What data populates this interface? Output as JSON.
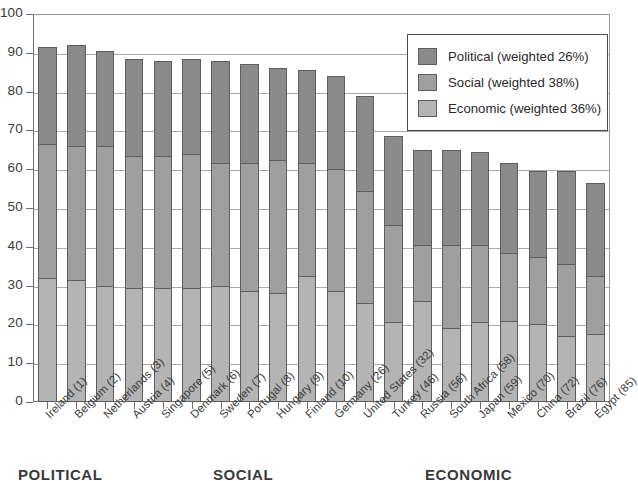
{
  "chart_data": {
    "type": "bar",
    "subtype": "stacked-bar",
    "title": "",
    "xlabel": "",
    "ylabel": "",
    "ylim": [
      0,
      100
    ],
    "ytick_step": 10,
    "yticks": [
      0,
      10,
      20,
      30,
      40,
      50,
      60,
      70,
      80,
      90,
      100
    ],
    "grid": true,
    "grid_axis": "y",
    "legend_position": "top-right",
    "categories": [
      "Ireland (1)",
      "Belgium (2)",
      "Netherlands (3)",
      "Austria (4)",
      "Singapore (5)",
      "Denmark (6)",
      "Sweden (7)",
      "Portugal (8)",
      "Hungary (9)",
      "Finland (10)",
      "Germany (26)",
      "United States (32)",
      "Turkey (46)",
      "Russia (56)",
      "South Africa (58)",
      "Japan (59)",
      "Mexico (70)",
      "China (72)",
      "Brazil (76)",
      "Egypt (85)"
    ],
    "series": [
      {
        "name": "Economic (weighted 36%)",
        "color": "#b4b4b4",
        "weight_percent": 36,
        "values": [
          32.0,
          31.5,
          30.0,
          29.5,
          29.5,
          29.5,
          30.0,
          28.5,
          28.0,
          32.5,
          28.5,
          25.5,
          20.5,
          26.0,
          19.0,
          20.5,
          21.0,
          20.0,
          17.0,
          17.5
        ]
      },
      {
        "name": "Social (weighted 38%)",
        "color": "#9f9f9f",
        "weight_percent": 38,
        "values": [
          34.5,
          34.5,
          36.0,
          34.0,
          34.0,
          34.5,
          31.5,
          33.0,
          34.5,
          29.0,
          31.5,
          29.0,
          25.0,
          14.5,
          21.5,
          20.0,
          17.5,
          17.5,
          18.5,
          15.0
        ]
      },
      {
        "name": "Political (weighted 26%)",
        "color": "#8a8a8a",
        "weight_percent": 26,
        "values": [
          25.0,
          26.0,
          24.5,
          25.0,
          24.5,
          24.5,
          26.5,
          25.5,
          23.5,
          24.0,
          24.0,
          24.5,
          23.0,
          24.5,
          24.5,
          24.0,
          23.0,
          22.0,
          24.0,
          24.0
        ]
      }
    ],
    "totals": [
      91.5,
      92.0,
      90.5,
      88.5,
      88.0,
      88.5,
      88.0,
      87.0,
      86.0,
      85.5,
      84.0,
      79.0,
      68.5,
      65.0,
      65.0,
      64.5,
      61.5,
      59.5,
      59.5,
      56.5
    ],
    "stack_order_bottom_to_top": [
      "Economic (weighted 36%)",
      "Social (weighted 38%)",
      "Political (weighted 26%)"
    ]
  },
  "legend": {
    "items": [
      {
        "label": "Political (weighted 26%)",
        "color": "#8a8a8a"
      },
      {
        "label": "Social (weighted 38%)",
        "color": "#9f9f9f"
      },
      {
        "label": "Economic (weighted 36%)",
        "color": "#b4b4b4"
      }
    ]
  },
  "yaxis": {
    "labels": [
      "100",
      "90",
      "80",
      "70",
      "60",
      "50",
      "40",
      "30",
      "20",
      "10",
      "0"
    ]
  },
  "bottom_captions": [
    {
      "text": "POLITICAL",
      "left": 18
    },
    {
      "text": "SOCIAL",
      "left": 213
    },
    {
      "text": "ECONOMIC",
      "left": 425
    }
  ]
}
